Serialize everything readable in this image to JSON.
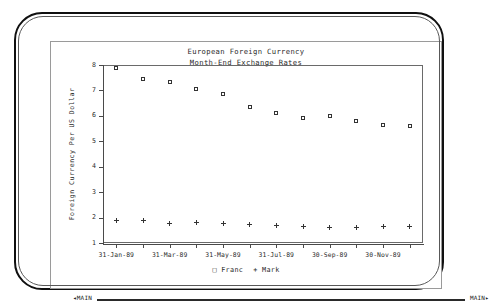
{
  "screen": {
    "title_line1": "European Foreign Currency",
    "title_line2": "Month-End Exchange Rates"
  },
  "status_bar": {
    "left_arrow": "◂",
    "left_label": "MAIN",
    "right_label": "MAIN",
    "right_arrow": "▸"
  },
  "legend": {
    "entries": [
      {
        "symbol": "□",
        "label": "Franc"
      },
      {
        "symbol": "+",
        "label": "Mark"
      }
    ]
  },
  "chart_data": {
    "type": "scatter",
    "xlabel": "",
    "ylabel": "Foreign Currency Per US Dollar",
    "ylim": [
      1,
      8
    ],
    "yticks": [
      1,
      2,
      3,
      4,
      5,
      6,
      7,
      8
    ],
    "ytick_labels": [
      "1",
      "2",
      "3",
      "4",
      "5",
      "6",
      "7",
      "8"
    ],
    "grid": false,
    "legend_position": "bottom-center",
    "categories": [
      "31-Jan-89",
      "28-Feb-89",
      "31-Mar-89",
      "30-Apr-89",
      "31-May-89",
      "30-Jun-89",
      "31-Jul-89",
      "31-Aug-89",
      "30-Sep-89",
      "31-Oct-89",
      "30-Nov-89",
      "31-Dec-89"
    ],
    "xtick_labels": [
      "31-Jan-89",
      "",
      "31-Mar-89",
      "",
      "31-May-89",
      "",
      "31-Jul-89",
      "",
      "30-Sep-89",
      "",
      "30-Nov-89",
      ""
    ],
    "series": [
      {
        "name": "Franc",
        "marker": "square",
        "values": [
          7.9,
          7.45,
          7.35,
          7.05,
          6.85,
          6.35,
          6.1,
          5.9,
          6.0,
          5.8,
          5.65,
          5.6
        ]
      },
      {
        "name": "Mark",
        "marker": "plus",
        "values": [
          1.88,
          1.87,
          1.75,
          1.8,
          1.78,
          1.72,
          1.7,
          1.67,
          1.62,
          1.63,
          1.65,
          1.65
        ]
      }
    ]
  }
}
